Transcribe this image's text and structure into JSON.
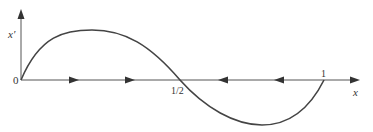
{
  "diagram": {
    "type": "phase-line",
    "y_axis_label": "x′",
    "x_axis_label": "x",
    "origin_label": "0",
    "tick_labels": [
      "1/2",
      "1"
    ],
    "fixed_points": [
      0,
      0.5,
      1
    ],
    "flow_arrows": [
      {
        "position": "between 0 and 1/2",
        "direction": "right"
      },
      {
        "position": "between 0 and 1/2",
        "direction": "right"
      },
      {
        "position": "between 1/2 and 1",
        "direction": "left"
      },
      {
        "position": "between 1/2 and 1",
        "direction": "left"
      }
    ],
    "curve": "x′ = f(x), positive on (0,1/2), negative on (1/2,1)",
    "colors": {
      "axis": "#555555",
      "curve": "#444444",
      "text": "#333333"
    }
  }
}
